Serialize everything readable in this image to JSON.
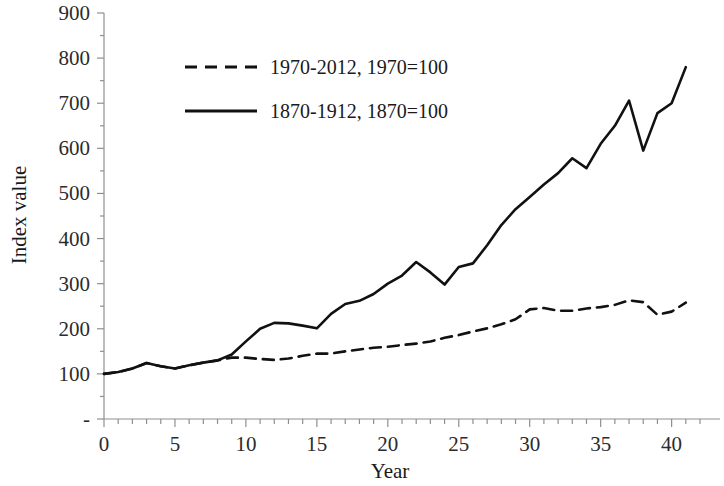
{
  "chart_data": {
    "type": "line",
    "title": "",
    "xlabel": "Year",
    "ylabel": "Index value",
    "xlim": [
      0,
      42
    ],
    "ylim": [
      0,
      900
    ],
    "x_ticks": [
      0,
      5,
      10,
      15,
      20,
      25,
      30,
      35,
      40
    ],
    "x_tick_labels": [
      "0",
      "5",
      "10",
      "15",
      "20",
      "25",
      "30",
      "35",
      "40"
    ],
    "x_minor_tick_step": 1,
    "y_ticks": [
      0,
      100,
      200,
      300,
      400,
      500,
      600,
      700,
      800,
      900
    ],
    "y_tick_labels": [
      "-",
      "100",
      "200",
      "300",
      "400",
      "500",
      "600",
      "700",
      "800",
      "900"
    ],
    "grid": false,
    "legend_position": "upper-left-inside",
    "x": [
      0,
      1,
      2,
      3,
      4,
      5,
      6,
      7,
      8,
      9,
      10,
      11,
      12,
      13,
      14,
      15,
      16,
      17,
      18,
      19,
      20,
      21,
      22,
      23,
      24,
      25,
      26,
      27,
      28,
      29,
      30,
      31,
      32,
      33,
      34,
      35,
      36,
      37,
      38,
      39,
      40,
      41
    ],
    "series": [
      {
        "name": "1970-2012, 1970=100",
        "style": "dashed",
        "color": "#111111",
        "values": [
          100,
          104,
          112,
          124,
          117,
          112,
          119,
          125,
          130,
          136,
          136,
          133,
          131,
          134,
          140,
          145,
          145,
          150,
          154,
          158,
          160,
          164,
          167,
          172,
          180,
          186,
          194,
          201,
          210,
          221,
          243,
          246,
          240,
          240,
          245,
          248,
          253,
          263,
          259,
          231,
          238,
          258
        ]
      },
      {
        "name": "1870-1912, 1870=100",
        "style": "solid",
        "color": "#111111",
        "values": [
          100,
          104,
          112,
          124,
          117,
          112,
          119,
          125,
          130,
          143,
          172,
          200,
          213,
          212,
          207,
          201,
          233,
          255,
          262,
          277,
          300,
          318,
          348,
          325,
          298,
          337,
          345,
          385,
          430,
          465,
          492,
          520,
          545,
          578,
          556,
          610,
          650,
          706,
          595,
          678,
          700,
          780
        ]
      }
    ]
  },
  "legend": {
    "entries": [
      {
        "label": "1970-2012, 1970=100",
        "style": "dashed"
      },
      {
        "label": "1870-1912, 1870=100",
        "style": "solid"
      }
    ]
  },
  "axes": {
    "y_title": "Index value",
    "x_title": "Year"
  }
}
